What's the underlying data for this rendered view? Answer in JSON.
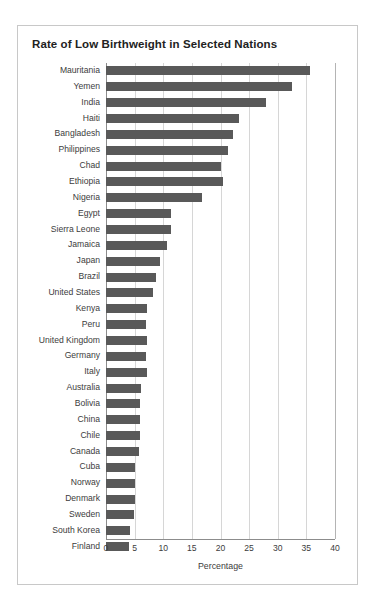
{
  "panel": {
    "title": "Rate of Low Birthweight in Selected Nations"
  },
  "chart_data": {
    "type": "bar",
    "orientation": "horizontal",
    "title": "Rate of Low Birthweight in Selected Nations",
    "xlabel": "Percentage",
    "ylabel": "",
    "xlim": [
      0,
      40
    ],
    "xticks": [
      0,
      5,
      10,
      15,
      20,
      25,
      30,
      35,
      40
    ],
    "grid": true,
    "legend": false,
    "bar_color": "#595959",
    "grid_color": "#d6d6d6",
    "axis_color": "#8c8c8c",
    "categories": [
      "Mauritania",
      "Yemen",
      "India",
      "Haiti",
      "Bangladesh",
      "Philippines",
      "Chad",
      "Ethiopia",
      "Nigeria",
      "Egypt",
      "Sierra Leone",
      "Jamaica",
      "Japan",
      "Brazil",
      "United States",
      "Kenya",
      "Peru",
      "United Kingdom",
      "Germany",
      "Italy",
      "Australia",
      "Bolivia",
      "China",
      "Chile",
      "Canada",
      "Cuba",
      "Norway",
      "Denmark",
      "Sweden",
      "South Korea",
      "Finland"
    ],
    "values": [
      35.7,
      32.5,
      28.0,
      23.2,
      22.2,
      21.3,
      20.1,
      20.5,
      16.8,
      11.4,
      11.3,
      10.6,
      9.4,
      8.8,
      8.2,
      7.2,
      7.0,
      7.2,
      7.0,
      7.1,
      6.2,
      6.0,
      6.0,
      5.9,
      5.8,
      5.1,
      5.0,
      5.0,
      4.9,
      4.2,
      4.0
    ]
  }
}
